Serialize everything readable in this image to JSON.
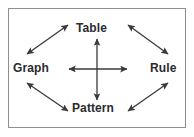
{
  "figure": {
    "background_color": "#ffffff",
    "border_color": "#8d8d92",
    "arrow_color": "#3a3a3e",
    "label_color": "#2b2b2f"
  },
  "nodes": {
    "top": {
      "label": "Table",
      "name": "node-table"
    },
    "left": {
      "label": "Graph",
      "name": "node-graph"
    },
    "right": {
      "label": "Rule",
      "name": "node-rule"
    },
    "bottom": {
      "label": "Pattern",
      "name": "node-pattern"
    }
  },
  "connectors": [
    {
      "id": "vertical-center",
      "from": "Pattern",
      "to": "Table",
      "style": "double-headed",
      "orientation": "vertical"
    },
    {
      "id": "horizontal-center",
      "from": "Graph",
      "to": "Rule",
      "style": "double-headed",
      "orientation": "horizontal"
    },
    {
      "id": "graph-table",
      "from": "Graph",
      "to": "Table",
      "style": "double-headed",
      "orientation": "diagonal-up-right"
    },
    {
      "id": "table-rule",
      "from": "Table",
      "to": "Rule",
      "style": "double-headed",
      "orientation": "diagonal-down-right"
    },
    {
      "id": "graph-pattern",
      "from": "Graph",
      "to": "Pattern",
      "style": "double-headed",
      "orientation": "diagonal-down-right"
    },
    {
      "id": "pattern-rule",
      "from": "Pattern",
      "to": "Rule",
      "style": "double-headed",
      "orientation": "diagonal-up-right"
    }
  ]
}
